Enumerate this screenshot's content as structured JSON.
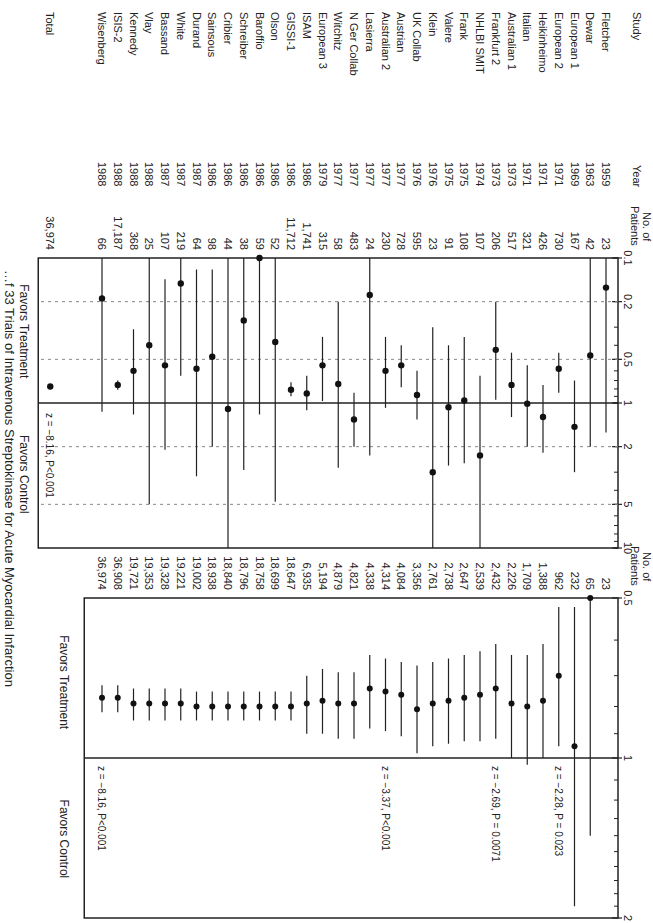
{
  "chart_data": [
    {
      "type": "forest",
      "panel": "individual",
      "title": "",
      "columns": {
        "study": "Study",
        "year": "Year",
        "patients": "No. of Patients"
      },
      "xscale": "log",
      "xlim": [
        0.1,
        10
      ],
      "xticks": [
        "0.1",
        "0.2",
        "0.5",
        "1",
        "2",
        "5",
        "10"
      ],
      "reference_line": 1,
      "favors_left": "Favors Treatment",
      "favors_right": "Favors Control",
      "rows": [
        {
          "study": "Fletcher",
          "year": "1959",
          "patients": "23",
          "or": 0.16,
          "lo": 0.02,
          "hi": 1.6
        },
        {
          "study": "Dewar",
          "year": "1963",
          "patients": "42",
          "or": 0.47,
          "lo": 0.1,
          "hi": 2.0
        },
        {
          "study": "European 1",
          "year": "1969",
          "patients": "167",
          "or": 1.46,
          "lo": 0.7,
          "hi": 3.0
        },
        {
          "study": "European 2",
          "year": "1971",
          "patients": "730",
          "or": 0.58,
          "lo": 0.45,
          "hi": 0.85
        },
        {
          "study": "Heikinheimo",
          "year": "1971",
          "patients": "426",
          "or": 1.25,
          "lo": 0.75,
          "hi": 2.2
        },
        {
          "study": "Italian",
          "year": "1971",
          "patients": "321",
          "or": 1.01,
          "lo": 0.55,
          "hi": 2.0
        },
        {
          "study": "Australian 1",
          "year": "1973",
          "patients": "517",
          "or": 0.75,
          "lo": 0.45,
          "hi": 1.25
        },
        {
          "study": "Frankfurt 2",
          "year": "1973",
          "patients": "206",
          "or": 0.43,
          "lo": 0.2,
          "hi": 0.95
        },
        {
          "study": "NHLBI SMIT",
          "year": "1974",
          "patients": "107",
          "or": 2.3,
          "lo": 0.65,
          "hi": 10
        },
        {
          "study": "Frank",
          "year": "1975",
          "patients": "108",
          "or": 0.96,
          "lo": 0.35,
          "hi": 2.6
        },
        {
          "study": "Valere",
          "year": "1975",
          "patients": "91",
          "or": 1.07,
          "lo": 0.4,
          "hi": 2.7
        },
        {
          "study": "Klein",
          "year": "1976",
          "patients": "23",
          "or": 3.0,
          "lo": 0.3,
          "hi": 10
        },
        {
          "study": "UK Collab",
          "year": "1976",
          "patients": "595",
          "or": 0.88,
          "lo": 0.6,
          "hi": 1.3
        },
        {
          "study": "Austrian",
          "year": "1977",
          "patients": "728",
          "or": 0.55,
          "lo": 0.4,
          "hi": 0.78
        },
        {
          "study": "Australian 2",
          "year": "1977",
          "patients": "230",
          "or": 0.6,
          "lo": 0.35,
          "hi": 1.08
        },
        {
          "study": "Lasierra",
          "year": "1977",
          "patients": "24",
          "or": 0.18,
          "lo": 0.02,
          "hi": 2.3
        },
        {
          "study": "N Ger Collab",
          "year": "1977",
          "patients": "483",
          "or": 1.3,
          "lo": 0.85,
          "hi": 2.0
        },
        {
          "study": "Witchitz",
          "year": "1977",
          "patients": "58",
          "or": 0.74,
          "lo": 0.2,
          "hi": 2.8
        },
        {
          "study": "European 3",
          "year": "1979",
          "patients": "315",
          "or": 0.55,
          "lo": 0.35,
          "hi": 0.97
        },
        {
          "study": "ISAM",
          "year": "1986",
          "patients": "1,741",
          "or": 0.86,
          "lo": 0.65,
          "hi": 1.12
        },
        {
          "study": "GISSI-1",
          "year": "1986",
          "patients": "11,712",
          "or": 0.81,
          "lo": 0.72,
          "hi": 0.9
        },
        {
          "study": "Olson",
          "year": "1986",
          "patients": "52",
          "or": 0.38,
          "lo": 0.05,
          "hi": 4.8
        },
        {
          "study": "Baroffio",
          "year": "1986",
          "patients": "59",
          "or": 0.1,
          "lo": 0.01,
          "hi": 1.2
        },
        {
          "study": "Schreiber",
          "year": "1986",
          "patients": "38",
          "or": 0.27,
          "lo": 0.03,
          "hi": 2.9
        },
        {
          "study": "Cribier",
          "year": "1986",
          "patients": "44",
          "or": 1.1,
          "lo": 0.1,
          "hi": 10
        },
        {
          "study": "Sainsous",
          "year": "1986",
          "patients": "98",
          "or": 0.48,
          "lo": 0.12,
          "hi": 2.0
        },
        {
          "study": "Durand",
          "year": "1987",
          "patients": "64",
          "or": 0.58,
          "lo": 0.12,
          "hi": 3.2
        },
        {
          "study": "White",
          "year": "1987",
          "patients": "219",
          "or": 0.15,
          "lo": 0.05,
          "hi": 0.65
        },
        {
          "study": "Bassand",
          "year": "1987",
          "patients": "107",
          "or": 0.55,
          "lo": 0.14,
          "hi": 2.1
        },
        {
          "study": "Vlay",
          "year": "1988",
          "patients": "25",
          "or": 0.4,
          "lo": 0.03,
          "hi": 5.0
        },
        {
          "study": "Kennedy",
          "year": "1988",
          "patients": "368",
          "or": 0.6,
          "lo": 0.31,
          "hi": 1.2
        },
        {
          "study": "ISIS-2",
          "year": "1988",
          "patients": "17,187",
          "or": 0.75,
          "lo": 0.7,
          "hi": 0.81
        },
        {
          "study": "Wisenberg",
          "year": "1988",
          "patients": "66",
          "or": 0.19,
          "lo": 0.02,
          "hi": 1.15
        }
      ],
      "total": {
        "label": "Total",
        "patients": "36,974",
        "or": 0.77
      },
      "annotation": "z = −8.16, P<0.001"
    },
    {
      "type": "forest",
      "panel": "cumulative",
      "columns": {
        "patients": "No. of Patients"
      },
      "xscale": "log",
      "xlim": [
        0.5,
        2
      ],
      "xticks": [
        "0.5",
        "1",
        "2"
      ],
      "reference_line": 1,
      "favors_left": "Favors Treatment",
      "favors_right": "Favors Control",
      "rows": [
        {
          "patients": "23",
          "or": null,
          "lo": null,
          "hi": null
        },
        {
          "patients": "65",
          "or": 0.5,
          "lo": 0.5,
          "hi": 1.4
        },
        {
          "patients": "232",
          "or": 0.95,
          "lo": 0.52,
          "hi": 1.9
        },
        {
          "patients": "962",
          "or": 0.7,
          "lo": 0.52,
          "hi": 0.95
        },
        {
          "patients": "1,388",
          "or": 0.78,
          "lo": 0.61,
          "hi": 1.0
        },
        {
          "patients": "1,709",
          "or": 0.8,
          "lo": 0.64,
          "hi": 1.03
        },
        {
          "patients": "2,226",
          "or": 0.79,
          "lo": 0.64,
          "hi": 1.0
        },
        {
          "patients": "2,432",
          "or": 0.74,
          "lo": 0.61,
          "hi": 0.92
        },
        {
          "patients": "2,539",
          "or": 0.76,
          "lo": 0.63,
          "hi": 0.93
        },
        {
          "patients": "2,647",
          "or": 0.77,
          "lo": 0.64,
          "hi": 0.93
        },
        {
          "patients": "2,738",
          "or": 0.78,
          "lo": 0.65,
          "hi": 0.94
        },
        {
          "patients": "2,761",
          "or": 0.79,
          "lo": 0.66,
          "hi": 0.95
        },
        {
          "patients": "3,356",
          "or": 0.81,
          "lo": 0.67,
          "hi": 0.98
        },
        {
          "patients": "4,084",
          "or": 0.76,
          "lo": 0.66,
          "hi": 0.91
        },
        {
          "patients": "4,314",
          "or": 0.75,
          "lo": 0.65,
          "hi": 0.89
        },
        {
          "patients": "4,338",
          "or": 0.74,
          "lo": 0.64,
          "hi": 0.88
        },
        {
          "patients": "4,821",
          "or": 0.79,
          "lo": 0.69,
          "hi": 0.92
        },
        {
          "patients": "4,879",
          "or": 0.79,
          "lo": 0.69,
          "hi": 0.92
        },
        {
          "patients": "5,194",
          "or": 0.78,
          "lo": 0.68,
          "hi": 0.9
        },
        {
          "patients": "6,935",
          "or": 0.79,
          "lo": 0.7,
          "hi": 0.9
        },
        {
          "patients": "18,647",
          "or": 0.8,
          "lo": 0.75,
          "hi": 0.85
        },
        {
          "patients": "18,699",
          "or": 0.8,
          "lo": 0.75,
          "hi": 0.85
        },
        {
          "patients": "18,758",
          "or": 0.8,
          "lo": 0.75,
          "hi": 0.85
        },
        {
          "patients": "18,796",
          "or": 0.8,
          "lo": 0.75,
          "hi": 0.85
        },
        {
          "patients": "18,840",
          "or": 0.8,
          "lo": 0.75,
          "hi": 0.85
        },
        {
          "patients": "18,938",
          "or": 0.8,
          "lo": 0.75,
          "hi": 0.85
        },
        {
          "patients": "19,002",
          "or": 0.8,
          "lo": 0.75,
          "hi": 0.85
        },
        {
          "patients": "19,221",
          "or": 0.79,
          "lo": 0.74,
          "hi": 0.85
        },
        {
          "patients": "19,328",
          "or": 0.79,
          "lo": 0.74,
          "hi": 0.85
        },
        {
          "patients": "19,353",
          "or": 0.79,
          "lo": 0.74,
          "hi": 0.85
        },
        {
          "patients": "19,721",
          "or": 0.79,
          "lo": 0.74,
          "hi": 0.85
        },
        {
          "patients": "36,908",
          "or": 0.77,
          "lo": 0.73,
          "hi": 0.82
        },
        {
          "patients": "36,974",
          "or": 0.77,
          "lo": 0.73,
          "hi": 0.82
        }
      ],
      "annotations": [
        {
          "row": 3,
          "text": "z = −2.28, P = 0.023"
        },
        {
          "row": 7,
          "text": "z = −2.69, P = 0.0071"
        },
        {
          "row": 14,
          "text": "z = −3.37, P<0.001"
        },
        {
          "row": 32,
          "text": "z = −8.16, P<0.001"
        }
      ]
    }
  ],
  "caption": "…f 33 Trials of Intravenous Streptokinase for Acute Myocardial Infarction"
}
